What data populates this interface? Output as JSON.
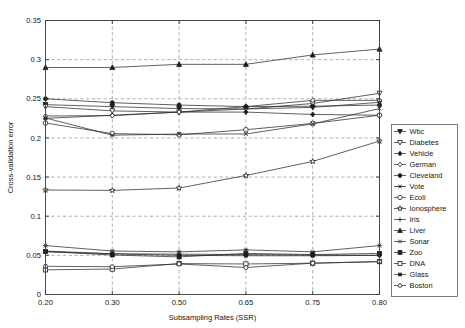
{
  "chart_data": {
    "type": "line",
    "title": "",
    "xlabel": "Subsampling Rates (SSR)",
    "ylabel": "Cross-validation error",
    "categories": [
      "0.20",
      "0.30",
      "0.50",
      "0.65",
      "0.75",
      "0.80"
    ],
    "x_tick_labels": [
      "0.20",
      "0.30",
      "0.50",
      "0.65",
      "0.75",
      "0.80"
    ],
    "y_tick_labels": [
      "0",
      "0.05",
      "0.1",
      "0.15",
      "0.2",
      "0.25",
      "0.3",
      "0.35"
    ],
    "y_tick_values": [
      0,
      0.05,
      0.1,
      0.15,
      0.2,
      0.25,
      0.3,
      0.35
    ],
    "ylim": [
      0,
      0.35
    ],
    "grid": true,
    "legend_position": "right-outside",
    "series": [
      {
        "name": "Wbc",
        "marker": "triangle-down-filled",
        "values": [
          0.2425,
          0.24,
          0.2375,
          0.237,
          0.239,
          0.2455
        ]
      },
      {
        "name": "Diabetes",
        "marker": "triangle-down-open",
        "values": [
          0.24,
          0.2345,
          0.233,
          0.237,
          0.244,
          0.257
        ]
      },
      {
        "name": "Vehicle",
        "marker": "diamond-filled",
        "values": [
          0.225,
          0.229,
          0.233,
          0.233,
          0.23,
          0.229
        ]
      },
      {
        "name": "German",
        "marker": "diamond-open",
        "values": [
          0.228,
          0.2285,
          0.233,
          0.24,
          0.248,
          0.248
        ]
      },
      {
        "name": "Cleveland",
        "marker": "circle-filled",
        "values": [
          0.25,
          0.245,
          0.242,
          0.24,
          0.2405,
          0.242
        ]
      },
      {
        "name": "Vote",
        "marker": "asterisk",
        "values": [
          0.0625,
          0.0555,
          0.0545,
          0.057,
          0.0545,
          0.0625
        ]
      },
      {
        "name": "Ecoli",
        "marker": "circle-open",
        "values": [
          0.219,
          0.2055,
          0.204,
          0.2105,
          0.2185,
          0.229
        ]
      },
      {
        "name": "Ionosphere",
        "marker": "star",
        "values": [
          0.1335,
          0.133,
          0.136,
          0.152,
          0.17,
          0.196
        ]
      },
      {
        "name": "Iris",
        "marker": "plus",
        "values": [
          0.0555,
          0.052,
          0.0515,
          0.051,
          0.0505,
          0.05
        ]
      },
      {
        "name": "Liver",
        "marker": "triangle-up-filled",
        "values": [
          0.29,
          0.29,
          0.294,
          0.294,
          0.306,
          0.3135
        ]
      },
      {
        "name": "Sonar",
        "marker": "x-mark",
        "values": [
          0.2255,
          0.2035,
          0.205,
          0.205,
          0.218,
          0.2375
        ]
      },
      {
        "name": "Zoo",
        "marker": "square-filled",
        "values": [
          0.055,
          0.0505,
          0.048,
          0.0525,
          0.051,
          0.0525
        ]
      },
      {
        "name": "DNA",
        "marker": "square-open",
        "values": [
          0.0315,
          0.0325,
          0.0395,
          0.039,
          0.04,
          0.042
        ]
      },
      {
        "name": "Glass",
        "marker": "square-small-filled",
        "values": [
          0.0545,
          0.052,
          0.05,
          0.0495,
          0.0495,
          0.05
        ]
      },
      {
        "name": "Boston",
        "marker": "circle-open-small",
        "values": [
          0.036,
          0.0355,
          0.039,
          0.0345,
          0.04,
          0.042
        ]
      }
    ]
  },
  "legend": {
    "items": [
      {
        "label": "Wbc"
      },
      {
        "label": "Diabetes"
      },
      {
        "label": "Vehicle"
      },
      {
        "label": "German"
      },
      {
        "label": "Cleveland"
      },
      {
        "label": "Vote"
      },
      {
        "label": "Ecoli"
      },
      {
        "label": "Ionosphere"
      },
      {
        "label": "Iris"
      },
      {
        "label": "Liver"
      },
      {
        "label": "Sonar"
      },
      {
        "label": "Zoo"
      },
      {
        "label": "DNA"
      },
      {
        "label": "Glass"
      },
      {
        "label": "Boston"
      }
    ]
  },
  "colors": {
    "line": "#2b2b2b",
    "grid": "#8d8d8d",
    "axis": "#3a3a3a",
    "background": "#ffffff"
  }
}
